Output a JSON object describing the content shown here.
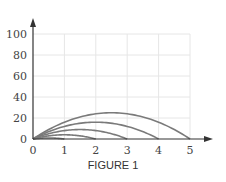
{
  "chart_data": {
    "type": "line",
    "title": "",
    "caption": "FIGURE 1",
    "xlabel": "",
    "ylabel": "",
    "xlim": [
      0,
      5.5
    ],
    "ylim": [
      0,
      110
    ],
    "x_ticks": [
      "0",
      "1",
      "2",
      "3",
      "4",
      "5"
    ],
    "y_ticks": [
      "0",
      "20",
      "40",
      "60",
      "80",
      "100"
    ],
    "grid": true,
    "legend": null,
    "series": [
      {
        "name": "curve 1",
        "formula": "y = 4x(1-x)",
        "x": [
          0,
          0.25,
          0.5,
          0.75,
          1
        ],
        "values": [
          0,
          0.75,
          1,
          0.75,
          0
        ],
        "peak": [
          0.5,
          1
        ],
        "range": 1
      },
      {
        "name": "curve 2",
        "formula": "y = 4x(2-x)",
        "x": [
          0,
          0.5,
          1,
          1.5,
          2
        ],
        "values": [
          0,
          3,
          4,
          3,
          0
        ],
        "peak": [
          1,
          4
        ],
        "range": 2
      },
      {
        "name": "curve 3",
        "formula": "y = 4x(3-x)",
        "x": [
          0,
          0.75,
          1.5,
          2.25,
          3
        ],
        "values": [
          0,
          6.75,
          9,
          6.75,
          0
        ],
        "peak": [
          1.5,
          9
        ],
        "range": 3
      },
      {
        "name": "curve 4",
        "formula": "y = 4x(4-x)",
        "x": [
          0,
          1,
          2,
          3,
          4
        ],
        "values": [
          0,
          12,
          16,
          12,
          0
        ],
        "peak": [
          2,
          16
        ],
        "range": 4
      },
      {
        "name": "curve 5",
        "formula": "y = 4x(5-x)",
        "x": [
          0,
          1.25,
          2.5,
          3.75,
          5
        ],
        "values": [
          0,
          18.75,
          25,
          18.75,
          0
        ],
        "peak": [
          2.5,
          25
        ],
        "range": 5
      }
    ],
    "series_scaled_peaks": [
      4,
      16,
      36,
      64,
      100
    ],
    "colors": {
      "curve": "#7a7a7a",
      "axis": "#333333",
      "grid": "#e6e6e6"
    }
  }
}
